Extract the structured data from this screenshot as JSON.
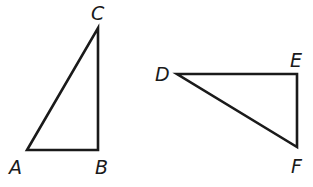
{
  "diagram": {
    "triangles": [
      {
        "name": "ABC",
        "right_angle_at": "B",
        "vertices": [
          {
            "label": "A",
            "x": 27,
            "y": 150
          },
          {
            "label": "B",
            "x": 98,
            "y": 150
          },
          {
            "label": "C",
            "x": 98,
            "y": 28
          }
        ]
      },
      {
        "name": "DEF",
        "right_angle_at": "E",
        "vertices": [
          {
            "label": "D",
            "x": 177,
            "y": 74
          },
          {
            "label": "E",
            "x": 297,
            "y": 74
          },
          {
            "label": "F",
            "x": 297,
            "y": 147
          }
        ]
      }
    ],
    "labels": {
      "A": "A",
      "B": "B",
      "C": "C",
      "D": "D",
      "E": "E",
      "F": "F"
    },
    "stroke_color": "#1a1a1a"
  }
}
